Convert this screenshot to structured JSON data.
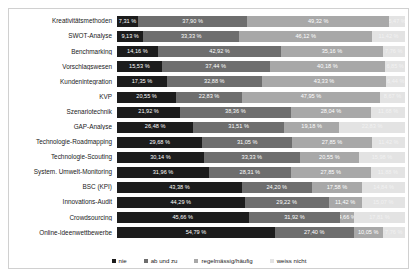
{
  "chart_data": {
    "type": "bar",
    "orientation": "horizontal",
    "stacked": true,
    "stacked_percent": true,
    "title": "",
    "xlabel": "",
    "ylabel": "",
    "xlim": [
      0,
      100
    ],
    "grid": false,
    "legend_position": "bottom",
    "legend": [
      "nie",
      "ab und zu",
      "regelmässig/häufig",
      "weiss nicht"
    ],
    "colors": [
      "#1c1c1c",
      "#6e6e6e",
      "#a8a8a8",
      "#e3e3e3"
    ],
    "categories": [
      "Kreativitätsmethoden",
      "SWOT-Analyse",
      "Benchmarking",
      "Vorschlagswesen",
      "Kundenintegration",
      "KVP",
      "Szenariotechnik",
      "GAP-Analyse",
      "Technologie-Roadmapping",
      "Technologie-Scouting",
      "System. Umwelt-Monitoring",
      "BSC (KPI)",
      "Innovations-Audit",
      "Crowdsourcing",
      "Online-Ideenwettbewerbe"
    ],
    "series": [
      {
        "name": "nie",
        "values": [
          7.31,
          9.13,
          14.16,
          15.53,
          17.35,
          20.55,
          21.92,
          26.48,
          29.68,
          30.14,
          31.96,
          43.38,
          44.29,
          45.66,
          54.79
        ]
      },
      {
        "name": "ab und zu",
        "values": [
          37.9,
          33.33,
          42.92,
          37.44,
          32.88,
          22.83,
          38.36,
          31.51,
          31.05,
          33.33,
          28.31,
          24.2,
          29.22,
          31.92,
          27.4
        ]
      },
      {
        "name": "regelmässig/häufig",
        "values": [
          49.32,
          46.12,
          35.16,
          40.18,
          43.33,
          47.95,
          28.04,
          19.18,
          27.85,
          20.55,
          27.85,
          17.58,
          11.42,
          4.66,
          10.05
        ]
      },
      {
        "name": "weiss nicht",
        "values": [
          5.47,
          11.42,
          7.76,
          6.85,
          6.44,
          8.67,
          11.68,
          22.83,
          11.42,
          15.98,
          11.88,
          14.84,
          15.07,
          17.81,
          7.76
        ]
      }
    ],
    "bar_labels": [
      [
        "7,31 %",
        "37,90 %",
        "49,32 %",
        "5,47 %"
      ],
      [
        "9,13 %",
        "33,33 %",
        "46,12 %",
        "11,42 %"
      ],
      [
        "14,16 %",
        "42,92 %",
        "35,16 %",
        "7,76 %"
      ],
      [
        "15,53 %",
        "37,44 %",
        "40,18 %",
        "6,85 %"
      ],
      [
        "17,35 %",
        "32,88 %",
        "43,33 %",
        "6,44 %"
      ],
      [
        "20,55 %",
        "22,83 %",
        "47,95 %",
        "8,67 %"
      ],
      [
        "21,92 %",
        "38,36 %",
        "28,04 %",
        "11,68 %"
      ],
      [
        "26,48 %",
        "31,51 %",
        "19,18 %",
        "22,83 %"
      ],
      [
        "29,68 %",
        "31,05 %",
        "27,85 %",
        "11,42 %"
      ],
      [
        "30,14 %",
        "33,33 %",
        "20,55 %",
        "15,98 %"
      ],
      [
        "31,96 %",
        "28,31 %",
        "27,85 %",
        "11,88 %"
      ],
      [
        "43,38 %",
        "24,20 %",
        "17,58 %",
        "14,84 %"
      ],
      [
        "44,29 %",
        "29,22 %",
        "11,42 %",
        "15,07 %"
      ],
      [
        "45,66 %",
        "31,92 %",
        "4,66 %",
        "17,81 %"
      ],
      [
        "54,79 %",
        "27,40 %",
        "10,05 %",
        "7,76 %"
      ]
    ]
  }
}
